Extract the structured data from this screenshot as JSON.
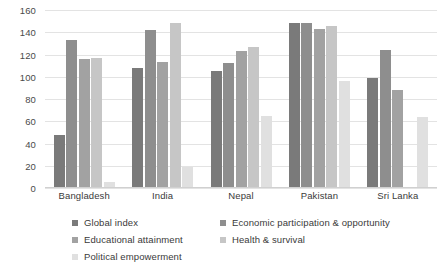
{
  "chart_data": {
    "type": "bar",
    "title": "",
    "subtitle": "",
    "xlabel": "",
    "ylabel": "",
    "ylim": [
      0,
      160
    ],
    "ytick_step": 20,
    "yticks": [
      0,
      20,
      40,
      60,
      80,
      100,
      120,
      140,
      160
    ],
    "grid": "horizontal",
    "legend_position": "bottom",
    "categories": [
      "Bangladesh",
      "India",
      "Nepal",
      "Pakistan",
      "Sri Lanka"
    ],
    "series": [
      {
        "name": "Global index",
        "color": "#7a7a7a",
        "values": [
          48,
          108,
          105,
          148,
          99
        ]
      },
      {
        "name": "Economic participation & opportunity",
        "color": "#8e8e8e",
        "values": [
          133,
          142,
          112,
          148,
          124
        ]
      },
      {
        "name": "Educational attainment",
        "color": "#a2a2a2",
        "values": [
          116,
          113,
          123,
          143,
          88
        ]
      },
      {
        "name": "Health & survival",
        "color": "#c6c6c6",
        "values": [
          117,
          148,
          127,
          146,
          0
        ]
      },
      {
        "name": "Political empowerment",
        "color": "#e0e0e0",
        "values": [
          5,
          19,
          65,
          96,
          64
        ]
      }
    ]
  },
  "colors": {
    "gridline": "#e3e3e3",
    "axis": "#d0d0d0",
    "text": "#3a3a3a",
    "background": "#ffffff"
  }
}
